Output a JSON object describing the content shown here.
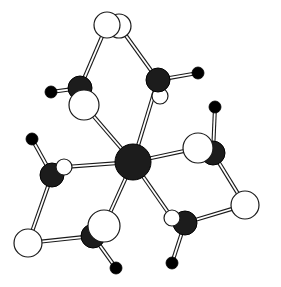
{
  "figure": {
    "kind": "ball-and-stick molecular structure diagram",
    "title": "",
    "caption": "",
    "background_color": "#ffffff",
    "canvas": {
      "width": 281,
      "height": 287
    },
    "atom_styles": {
      "dark_sphere": {
        "name": "metal/carbon (filled dark sphere)",
        "fill": "#1c1c1c",
        "stroke": "#000000"
      },
      "white_sphere": {
        "name": "oxygen (open white sphere)",
        "fill": "#ffffff",
        "stroke": "#1a1a1a"
      },
      "small_black_sphere": {
        "name": "hydrogen/terminal (small solid black sphere)",
        "fill": "#000000",
        "stroke": "#000000"
      }
    },
    "bond_style": {
      "name": "open double-line stick",
      "stroke": "#1a1a1a",
      "fill": "#ffffff"
    },
    "counts": {
      "dark_spheres": 7,
      "white_spheres": 10,
      "small_black_spheres": 6,
      "bonds": 22
    },
    "atoms": [
      {
        "id": "M1",
        "type": "dark",
        "label": "central metal",
        "cx": 133,
        "cy": 162,
        "r": 18,
        "z": 40
      },
      {
        "id": "C1",
        "type": "dark",
        "label": "carbon upper-left",
        "cx": 80,
        "cy": 88,
        "r": 12,
        "z": 30
      },
      {
        "id": "C2",
        "type": "dark",
        "label": "carbon upper-right",
        "cx": 158,
        "cy": 80,
        "r": 12,
        "z": 30
      },
      {
        "id": "C3",
        "type": "dark",
        "label": "carbon left",
        "cx": 52,
        "cy": 175,
        "r": 12,
        "z": 30
      },
      {
        "id": "C4",
        "type": "dark",
        "label": "carbon right",
        "cx": 213,
        "cy": 153,
        "r": 12,
        "z": 30
      },
      {
        "id": "C5",
        "type": "dark",
        "label": "carbon lower-left",
        "cx": 93,
        "cy": 236,
        "r": 12,
        "z": 30
      },
      {
        "id": "C6",
        "type": "dark",
        "label": "carbon lower-right",
        "cx": 185,
        "cy": 223,
        "r": 12,
        "z": 30
      },
      {
        "id": "O1",
        "type": "white",
        "label": "oxygen top-back",
        "cx": 119,
        "cy": 26,
        "r": 12,
        "z": 10
      },
      {
        "id": "O2",
        "type": "white",
        "label": "oxygen top-front",
        "cx": 107,
        "cy": 25,
        "r": 13,
        "z": 20
      },
      {
        "id": "O3",
        "type": "white",
        "label": "oxygen upper-left",
        "cx": 84,
        "cy": 105,
        "r": 15,
        "z": 35
      },
      {
        "id": "O4",
        "type": "white",
        "label": "oxygen upper-right",
        "cx": 160,
        "cy": 96,
        "r": 8,
        "z": 25
      },
      {
        "id": "O5",
        "type": "white",
        "label": "oxygen left-front",
        "cx": 64,
        "cy": 167,
        "r": 8,
        "z": 35
      },
      {
        "id": "O6",
        "type": "white",
        "label": "oxygen right",
        "cx": 198,
        "cy": 148,
        "r": 15,
        "z": 35
      },
      {
        "id": "O7",
        "type": "white",
        "label": "oxygen far-right",
        "cx": 245,
        "cy": 205,
        "r": 14,
        "z": 20
      },
      {
        "id": "O8",
        "type": "white",
        "label": "oxygen bottom-left",
        "cx": 28,
        "cy": 243,
        "r": 14,
        "z": 20
      },
      {
        "id": "O9",
        "type": "white",
        "label": "oxygen lower-center",
        "cx": 104,
        "cy": 226,
        "r": 16,
        "z": 35
      },
      {
        "id": "O10",
        "type": "white",
        "label": "oxygen lower-right",
        "cx": 172,
        "cy": 218,
        "r": 8,
        "z": 35
      },
      {
        "id": "H1",
        "type": "black",
        "label": "hydrogen upper-left",
        "cx": 51,
        "cy": 92,
        "r": 6,
        "z": 50
      },
      {
        "id": "H2",
        "type": "black",
        "label": "hydrogen upper-right",
        "cx": 198,
        "cy": 73,
        "r": 6,
        "z": 50
      },
      {
        "id": "H3",
        "type": "black",
        "label": "hydrogen left",
        "cx": 32,
        "cy": 139,
        "r": 6,
        "z": 50
      },
      {
        "id": "H4",
        "type": "black",
        "label": "hydrogen right",
        "cx": 215,
        "cy": 107,
        "r": 6,
        "z": 50
      },
      {
        "id": "H5",
        "type": "black",
        "label": "hydrogen bottom",
        "cx": 116,
        "cy": 268,
        "r": 6,
        "z": 50
      },
      {
        "id": "H6",
        "type": "black",
        "label": "hydrogen bottom-right",
        "cx": 172,
        "cy": 263,
        "r": 6,
        "z": 50
      }
    ],
    "bonds": [
      {
        "from": "M1",
        "to": "O3",
        "z": 15
      },
      {
        "from": "M1",
        "to": "C2",
        "z": 15
      },
      {
        "from": "M1",
        "to": "O5",
        "z": 15
      },
      {
        "from": "M1",
        "to": "O6",
        "z": 15
      },
      {
        "from": "M1",
        "to": "O9",
        "z": 15
      },
      {
        "from": "M1",
        "to": "O10",
        "z": 15
      },
      {
        "from": "C1",
        "to": "O2",
        "z": 5
      },
      {
        "from": "C1",
        "to": "O3",
        "z": 5
      },
      {
        "from": "C1",
        "to": "H1",
        "z": 5
      },
      {
        "from": "C2",
        "to": "O1",
        "z": 5
      },
      {
        "from": "C2",
        "to": "O4",
        "z": 5
      },
      {
        "from": "C2",
        "to": "H2",
        "z": 5
      },
      {
        "from": "C3",
        "to": "O5",
        "z": 5
      },
      {
        "from": "C3",
        "to": "H3",
        "z": 5
      },
      {
        "from": "C3",
        "to": "O8",
        "z": 5
      },
      {
        "from": "C4",
        "to": "O6",
        "z": 5
      },
      {
        "from": "C4",
        "to": "H4",
        "z": 5
      },
      {
        "from": "C4",
        "to": "O7",
        "z": 5
      },
      {
        "from": "C5",
        "to": "O9",
        "z": 5
      },
      {
        "from": "C5",
        "to": "O8",
        "z": 5
      },
      {
        "from": "C5",
        "to": "H5",
        "z": 5
      },
      {
        "from": "C6",
        "to": "O10",
        "z": 5
      },
      {
        "from": "C6",
        "to": "O7",
        "z": 5
      },
      {
        "from": "C6",
        "to": "H6",
        "z": 5
      }
    ]
  }
}
